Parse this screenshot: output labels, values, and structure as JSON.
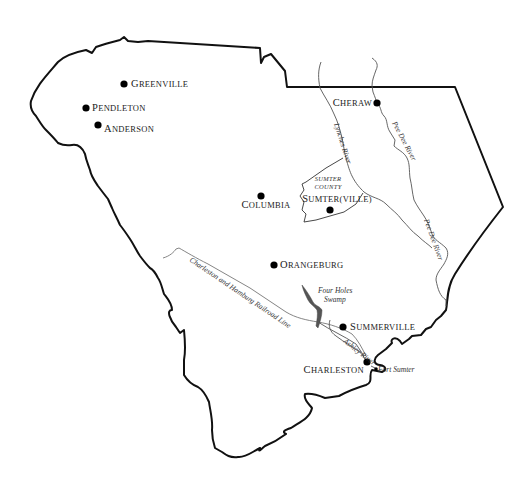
{
  "map": {
    "title": "",
    "colors": {
      "border": "#111111",
      "river": "#555555",
      "railroad": "#777777",
      "swamp": "#555555",
      "city": "#000000",
      "background": "#ffffff"
    },
    "cities": [
      {
        "id": "greenville",
        "label": "Greenville",
        "x": 124,
        "y": 84,
        "lx": 131,
        "ly": 87,
        "anchor": "start"
      },
      {
        "id": "pendleton",
        "label": "Pendleton",
        "x": 86,
        "y": 108,
        "lx": 92,
        "ly": 111,
        "anchor": "start"
      },
      {
        "id": "anderson",
        "label": "Anderson",
        "x": 98,
        "y": 125,
        "lx": 104,
        "ly": 132,
        "anchor": "start"
      },
      {
        "id": "cheraw",
        "label": "Cheraw",
        "x": 377,
        "y": 103,
        "lx": 372,
        "ly": 106,
        "anchor": "end"
      },
      {
        "id": "columbia",
        "label": "Columbia",
        "x": 261,
        "y": 196,
        "lx": 266,
        "ly": 208,
        "anchor": "middle"
      },
      {
        "id": "sumterville",
        "label": "Sumter(ville)",
        "x": 330,
        "y": 210,
        "lx": 337,
        "ly": 202,
        "anchor": "middle"
      },
      {
        "id": "orangeburg",
        "label": "Orangeburg",
        "x": 274,
        "y": 265,
        "lx": 280,
        "ly": 268,
        "anchor": "start"
      },
      {
        "id": "summerville",
        "label": "Summerville",
        "x": 343,
        "y": 327,
        "lx": 350,
        "ly": 330,
        "anchor": "start"
      },
      {
        "id": "charleston",
        "label": "Charleston",
        "x": 367,
        "y": 362,
        "lx": 364,
        "ly": 373,
        "anchor": "end"
      }
    ],
    "features": [
      {
        "id": "lynches-river",
        "label": "Lynches River",
        "x": 334,
        "y": 124,
        "rotate": 72
      },
      {
        "id": "pee-dee-river-upper",
        "label": "Pee Dee River",
        "x": 392,
        "y": 123,
        "rotate": 62
      },
      {
        "id": "pee-dee-river-lower",
        "label": "Pee Dee River",
        "x": 424,
        "y": 220,
        "rotate": 70
      },
      {
        "id": "charleston-hamburg-railroad",
        "label": "Charleston and Hamburg Railroad Line",
        "x": 189,
        "y": 261,
        "rotate": 34
      },
      {
        "id": "four-holes-swamp",
        "label": "Four Holes",
        "label2": "Swamp",
        "x": 318,
        "y": 293
      },
      {
        "id": "ashley-river",
        "label": "Ashley River",
        "x": 343,
        "y": 342,
        "rotate": 38
      },
      {
        "id": "fort-sumter",
        "label": "Fort Sumter",
        "x": 378,
        "y": 372
      }
    ],
    "county": {
      "id": "sumter-county",
      "line1": "Sumter",
      "line2": "County",
      "x": 328,
      "y": 181
    }
  }
}
